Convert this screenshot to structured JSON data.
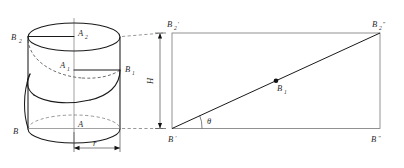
{
  "figure": {
    "background_color": "#ffffff",
    "ink_color": "#1a1a1a"
  },
  "cylinder": {
    "name": "cylinder-with-helix",
    "labels": {
      "top_left": "B",
      "top_left_sub": "2",
      "top_center": "A",
      "top_center_sub": "2",
      "mid_center": "A",
      "mid_center_sub": "1",
      "mid_right": "B",
      "mid_right_sub": "1",
      "bottom_left": "B",
      "bottom_center": "A",
      "radius": "r"
    }
  },
  "development": {
    "name": "unrolled-rectangle",
    "labels": {
      "top_left": "B",
      "top_left_sub": "2",
      "top_left_prime": "′",
      "top_right": "B",
      "top_right_sub": "2",
      "top_right_prime": "″",
      "bottom_left": "B",
      "bottom_left_prime": "′",
      "bottom_right": "B",
      "bottom_right_prime": "″",
      "midpoint": "B",
      "midpoint_sub": "1",
      "angle": "θ",
      "height": "H"
    }
  }
}
